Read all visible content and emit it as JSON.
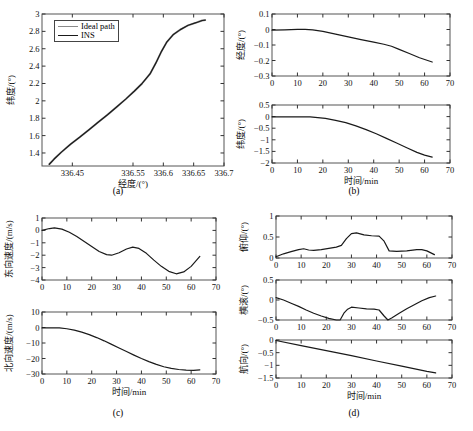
{
  "figure": {
    "background": "#ffffff",
    "line_color": "#1a1a1a",
    "ideal_color": "#8a8a8a"
  },
  "captions": {
    "a": "(a)",
    "b": "(b)",
    "c": "(c)",
    "d": "(d)"
  },
  "legend": {
    "items": [
      {
        "label": "Ideal path",
        "color": "#8a8a8a"
      },
      {
        "label": "INS",
        "color": "#1a1a1a"
      }
    ]
  },
  "axis_titles": {
    "time": "时间/min",
    "longitude": "经度/(°)",
    "latitude": "纬度/(°)",
    "east_velocity": "东向速度/(m/s)",
    "north_velocity": "北向速度/(m/s)",
    "pitch": "俯仰/(°)",
    "roll": "横滚/(°)",
    "heading": "航向/(°)"
  },
  "chart_data": [
    {
      "id": "a",
      "type": "line",
      "title": "",
      "xlabel": "经度/(°)",
      "ylabel": "纬度/(°)",
      "xlim": [
        336.4,
        336.7
      ],
      "ylim": [
        1.25,
        3
      ],
      "xticks": [
        336.45,
        336.55,
        336.6,
        336.65,
        336.7
      ],
      "xticklabels": [
        "336.45",
        "336.55",
        "336.6",
        "336.65",
        "336.7"
      ],
      "yticks": [
        1.4,
        1.6,
        1.8,
        2,
        2.2,
        2.4,
        2.6,
        2.8,
        3
      ],
      "yticklabels": [
        "1.4",
        "1.6",
        "1.8",
        "2",
        "2.2",
        "2.4",
        "2.6",
        "2.8",
        "3"
      ],
      "grid": false,
      "legend_position": "upper-left",
      "series": [
        {
          "name": "Ideal path",
          "color": "#8a8a8a",
          "x": [
            336.412,
            336.42,
            336.432,
            336.447,
            336.462,
            336.478,
            336.492,
            336.508,
            336.523,
            336.538,
            336.552,
            336.565,
            336.578,
            336.588,
            336.597,
            336.606,
            336.616,
            336.628,
            336.641,
            336.654,
            336.664,
            336.669
          ],
          "y": [
            1.27,
            1.33,
            1.41,
            1.5,
            1.58,
            1.67,
            1.75,
            1.84,
            1.93,
            2.02,
            2.11,
            2.2,
            2.31,
            2.44,
            2.57,
            2.68,
            2.76,
            2.82,
            2.87,
            2.9,
            2.925,
            2.93
          ]
        },
        {
          "name": "INS",
          "color": "#1a1a1a",
          "x": [
            336.412,
            336.42,
            336.432,
            336.447,
            336.462,
            336.478,
            336.492,
            336.508,
            336.523,
            336.538,
            336.552,
            336.565,
            336.578,
            336.588,
            336.597,
            336.606,
            336.616,
            336.628,
            336.641,
            336.654,
            336.664,
            336.669
          ],
          "y": [
            1.27,
            1.33,
            1.41,
            1.5,
            1.58,
            1.67,
            1.75,
            1.84,
            1.93,
            2.02,
            2.11,
            2.2,
            2.31,
            2.44,
            2.57,
            2.68,
            2.76,
            2.82,
            2.87,
            2.9,
            2.925,
            2.93
          ]
        }
      ]
    },
    {
      "id": "b-top",
      "type": "line",
      "xlabel": "",
      "ylabel": "经度/(°)",
      "xlim": [
        0,
        70
      ],
      "ylim": [
        -0.3,
        0.1
      ],
      "xticks": [
        0,
        10,
        20,
        30,
        40,
        50,
        60,
        70
      ],
      "yticks": [
        -0.3,
        -0.2,
        -0.1,
        0,
        0.1
      ],
      "yticklabels": [
        "−0.3",
        "−0.2",
        "−0.1",
        "0",
        "0.1"
      ],
      "grid": false,
      "series": [
        {
          "name": "longitude error",
          "color": "#1a1a1a",
          "x": [
            0,
            5,
            10,
            13,
            16,
            20,
            25,
            30,
            35,
            40,
            44,
            47,
            50,
            54,
            58,
            63
          ],
          "y": [
            -0.004,
            -0.002,
            0.001,
            0.001,
            -0.002,
            -0.012,
            -0.03,
            -0.048,
            -0.065,
            -0.082,
            -0.095,
            -0.108,
            -0.128,
            -0.155,
            -0.182,
            -0.21
          ]
        }
      ]
    },
    {
      "id": "b-bottom",
      "type": "line",
      "xlabel": "时间/min",
      "ylabel": "纬度/(°)",
      "xlim": [
        0,
        70
      ],
      "ylim": [
        -2,
        0.5
      ],
      "xticks": [
        0,
        10,
        20,
        30,
        40,
        50,
        60,
        70
      ],
      "yticks": [
        -2,
        -1.5,
        -1,
        -0.5,
        0,
        0.5
      ],
      "yticklabels": [
        "−2",
        "−1.5",
        "−1",
        "−0.5",
        "0",
        "0.5"
      ],
      "grid": false,
      "series": [
        {
          "name": "latitude error",
          "color": "#1a1a1a",
          "x": [
            0,
            5,
            10,
            15,
            18,
            21,
            25,
            29,
            33,
            37,
            41,
            45,
            49,
            53,
            57,
            60,
            63
          ],
          "y": [
            -0.01,
            -0.01,
            -0.01,
            -0.015,
            -0.04,
            -0.08,
            -0.16,
            -0.26,
            -0.4,
            -0.56,
            -0.74,
            -0.94,
            -1.14,
            -1.34,
            -1.54,
            -1.66,
            -1.75
          ]
        }
      ]
    },
    {
      "id": "c-top",
      "type": "line",
      "xlabel": "",
      "ylabel": "东向速度/(m/s)",
      "xlim": [
        0,
        70
      ],
      "ylim": [
        -4,
        1
      ],
      "xticks": [
        0,
        10,
        20,
        30,
        40,
        50,
        60,
        70
      ],
      "yticks": [
        -4,
        -3,
        -2,
        -1,
        0,
        1
      ],
      "yticklabels": [
        "−4",
        "−3",
        "−2",
        "−1",
        "0",
        "1"
      ],
      "grid": false,
      "series": [
        {
          "name": "east velocity error",
          "color": "#1a1a1a",
          "x": [
            0,
            3,
            5,
            8,
            11,
            14,
            17,
            20,
            23,
            26,
            28,
            31,
            34,
            36.5,
            39,
            42,
            45,
            48,
            51,
            54,
            57,
            60,
            63.5
          ],
          "y": [
            0.0,
            0.15,
            0.2,
            0.1,
            -0.15,
            -0.5,
            -0.9,
            -1.3,
            -1.7,
            -1.95,
            -2.0,
            -1.8,
            -1.5,
            -1.35,
            -1.45,
            -1.85,
            -2.4,
            -2.9,
            -3.3,
            -3.5,
            -3.35,
            -2.9,
            -2.1
          ]
        }
      ]
    },
    {
      "id": "c-bottom",
      "type": "line",
      "xlabel": "时间/min",
      "ylabel": "北向速度/(m/s)",
      "xlim": [
        0,
        70
      ],
      "ylim": [
        -30,
        10
      ],
      "xticks": [
        0,
        10,
        20,
        30,
        40,
        50,
        60,
        70
      ],
      "yticks": [
        -30,
        -20,
        -10,
        0,
        10
      ],
      "yticklabels": [
        "−30",
        "−20",
        "−10",
        "0",
        "10"
      ],
      "grid": false,
      "series": [
        {
          "name": "north velocity error",
          "color": "#1a1a1a",
          "x": [
            0,
            4,
            7,
            10,
            13,
            16,
            19,
            22,
            25,
            28,
            31,
            34,
            37,
            40,
            43,
            46,
            49,
            52,
            55,
            58,
            61,
            63.5
          ],
          "y": [
            -0.3,
            -0.2,
            -0.3,
            -0.8,
            -1.7,
            -3.0,
            -4.6,
            -6.5,
            -8.6,
            -10.9,
            -13.2,
            -15.5,
            -17.8,
            -20.0,
            -22.0,
            -23.8,
            -25.3,
            -26.4,
            -27.1,
            -27.5,
            -27.6,
            -27.3
          ]
        }
      ]
    },
    {
      "id": "d-top",
      "type": "line",
      "xlabel": "",
      "ylabel": "俯仰/(°)",
      "xlim": [
        0,
        70
      ],
      "ylim": [
        0,
        1
      ],
      "xticks": [
        0,
        10,
        20,
        30,
        40,
        50,
        60,
        70
      ],
      "yticks": [
        0,
        0.5,
        1
      ],
      "yticklabels": [
        "0",
        "0.5",
        "1"
      ],
      "grid": false,
      "series": [
        {
          "name": "pitch error",
          "color": "#1a1a1a",
          "x": [
            0,
            3,
            6,
            9,
            11,
            13,
            15,
            18,
            21,
            24,
            26,
            28,
            30,
            32,
            35,
            38,
            41,
            43,
            45,
            48,
            52,
            56,
            58,
            60,
            63
          ],
          "y": [
            0.03,
            0.1,
            0.15,
            0.2,
            0.22,
            0.19,
            0.18,
            0.2,
            0.23,
            0.26,
            0.3,
            0.46,
            0.58,
            0.6,
            0.55,
            0.53,
            0.52,
            0.4,
            0.17,
            0.16,
            0.17,
            0.2,
            0.2,
            0.17,
            0.08
          ]
        }
      ]
    },
    {
      "id": "d-middle",
      "type": "line",
      "xlabel": "",
      "ylabel": "横滚/(°)",
      "xlim": [
        0,
        70
      ],
      "ylim": [
        -0.5,
        0.5
      ],
      "xticks": [
        0,
        10,
        20,
        30,
        40,
        50,
        60,
        70
      ],
      "yticks": [
        -0.5,
        0,
        0.5
      ],
      "yticklabels": [
        "−0.5",
        "0",
        "0.5"
      ],
      "grid": false,
      "series": [
        {
          "name": "roll error",
          "color": "#1a1a1a",
          "x": [
            0,
            3,
            6,
            9,
            12,
            15,
            18,
            21,
            24,
            25.5,
            27,
            28.5,
            30,
            33,
            36,
            39,
            41,
            43,
            44.5,
            46,
            49,
            52,
            55,
            58,
            61,
            63.5
          ],
          "y": [
            0.06,
            0.0,
            -0.08,
            -0.16,
            -0.25,
            -0.33,
            -0.4,
            -0.46,
            -0.5,
            -0.5,
            -0.33,
            -0.23,
            -0.18,
            -0.2,
            -0.22,
            -0.23,
            -0.25,
            -0.4,
            -0.5,
            -0.45,
            -0.33,
            -0.22,
            -0.12,
            -0.02,
            0.06,
            0.1
          ]
        }
      ]
    },
    {
      "id": "d-bottom",
      "type": "line",
      "xlabel": "时间/min",
      "ylabel": "航向/(°)",
      "xlim": [
        0,
        70
      ],
      "ylim": [
        -1.5,
        0
      ],
      "xticks": [
        0,
        10,
        20,
        30,
        40,
        50,
        60,
        70
      ],
      "yticks": [
        -1.5,
        -1,
        -0.5,
        0
      ],
      "yticklabels": [
        "−1.5",
        "−1",
        "−0.5",
        "0"
      ],
      "grid": false,
      "series": [
        {
          "name": "heading error",
          "color": "#1a1a1a",
          "x": [
            0,
            10,
            20,
            30,
            40,
            50,
            60,
            63.5
          ],
          "y": [
            -0.02,
            -0.22,
            -0.42,
            -0.62,
            -0.83,
            -1.03,
            -1.24,
            -1.3
          ]
        }
      ]
    }
  ]
}
